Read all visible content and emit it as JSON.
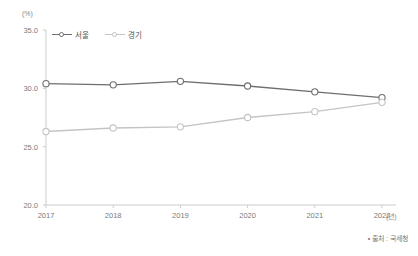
{
  "chart_data": {
    "type": "line",
    "title": "",
    "subtitle": "",
    "xlabel": "(년)",
    "ylabel": "(%)",
    "categories": [
      "2017",
      "2018",
      "2019",
      "2020",
      "2021",
      "2022"
    ],
    "ylim": [
      20.0,
      35.0
    ],
    "yticks": [
      "20.0",
      "25.0",
      "30.0",
      "35.0"
    ],
    "ytick_values": [
      20.0,
      25.0,
      30.0,
      35.0
    ],
    "grid": false,
    "legend_position": "top-left",
    "series": [
      {
        "name": "서울",
        "color": "#6e6e6e",
        "marker": "circle-open",
        "values": [
          30.4,
          30.3,
          30.6,
          30.2,
          29.7,
          29.2
        ]
      },
      {
        "name": "경기",
        "color": "#c4c4c4",
        "marker": "circle-open",
        "values": [
          26.3,
          26.6,
          26.7,
          27.5,
          28.0,
          28.8
        ]
      }
    ],
    "annotations": {
      "source": "• 출처 : 국세청"
    },
    "axis_color": "#cccccc",
    "text_color": "#7a7a7a"
  }
}
